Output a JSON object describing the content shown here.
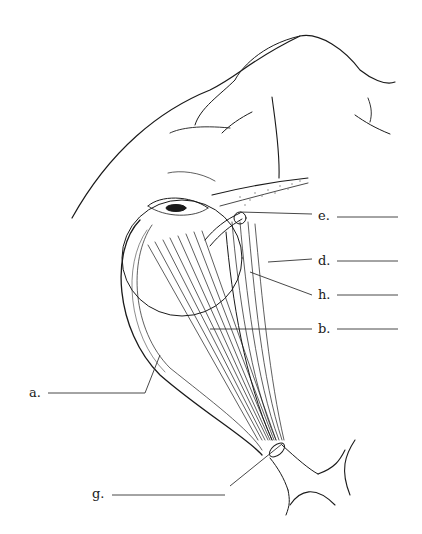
{
  "diagram": {
    "labels": [
      {
        "id": "e",
        "text": "e.",
        "x": 318,
        "y": 209
      },
      {
        "id": "d",
        "text": "d.",
        "x": 318,
        "y": 254
      },
      {
        "id": "h",
        "text": "h.",
        "x": 318,
        "y": 288
      },
      {
        "id": "b",
        "text": "b.",
        "x": 318,
        "y": 322
      },
      {
        "id": "a",
        "text": "a.",
        "x": 29,
        "y": 387
      },
      {
        "id": "g",
        "text": "g.",
        "x": 92,
        "y": 488
      }
    ],
    "colors": {
      "ink": "#1a1a1a",
      "line": "#333333",
      "stipple": "#888888"
    }
  }
}
